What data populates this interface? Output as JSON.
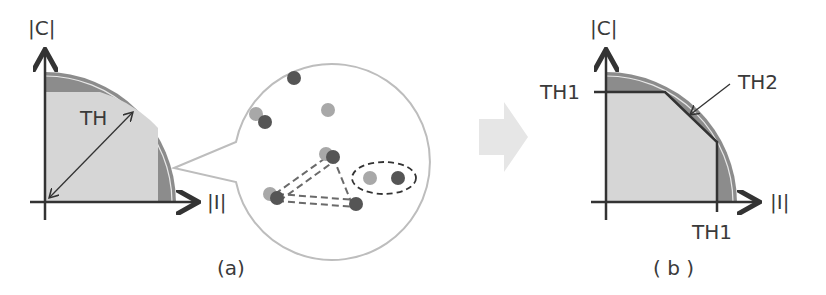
{
  "panel_a": {
    "caption": "(a)",
    "y_axis_label": "|C|",
    "x_axis_label": "|I|",
    "threshold_label": "TH",
    "callout": {
      "points": [
        {
          "x": 294,
          "y": 78,
          "shade": "dark"
        },
        {
          "x": 256,
          "y": 114,
          "shade": "light"
        },
        {
          "x": 265,
          "y": 122,
          "shade": "dark"
        },
        {
          "x": 328,
          "y": 110,
          "shade": "light"
        },
        {
          "x": 326,
          "y": 154,
          "shade": "light"
        },
        {
          "x": 333,
          "y": 157,
          "shade": "dark"
        },
        {
          "x": 270,
          "y": 194,
          "shade": "light"
        },
        {
          "x": 277,
          "y": 198,
          "shade": "dark"
        },
        {
          "x": 356,
          "y": 204,
          "shade": "dark"
        },
        {
          "x": 370,
          "y": 178,
          "shade": "light"
        },
        {
          "x": 398,
          "y": 178,
          "shade": "dark"
        }
      ],
      "triangle_edges": "dashed",
      "grouped_pair": "dashed-ellipse"
    }
  },
  "transition_arrow": "right-arrow",
  "panel_b": {
    "caption": "( b )",
    "y_axis_label": "|C|",
    "x_axis_label": "|I|",
    "th1_y_label": "TH1",
    "th1_x_label": "TH1",
    "th2_label": "TH2"
  },
  "colors": {
    "axis": "#333333",
    "fill_light": "#d6d6d6",
    "fill_dark": "#8c8c8c",
    "arc_outer": "#9a9a9a",
    "callout_stroke": "#bdbdbd",
    "arrow_fill": "#e6e6e6",
    "dot_dark": "#555555",
    "dot_light": "#a8a8a8"
  }
}
